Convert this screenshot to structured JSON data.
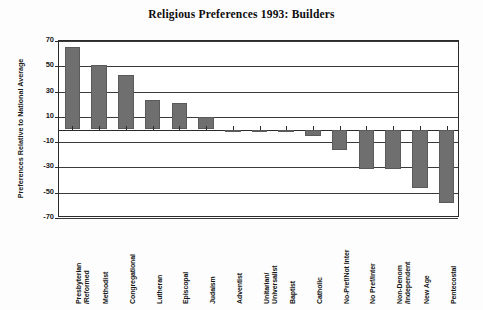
{
  "chart_data": {
    "type": "bar",
    "title": "Religious Preferences 1993: Builders",
    "xlabel": "",
    "ylabel": "Preferences Relative to National Average",
    "ylim": [
      -70,
      70
    ],
    "yticks": [
      70,
      50,
      30,
      10,
      -10,
      -30,
      -50,
      -70
    ],
    "grid": true,
    "legend": "none",
    "orientation": "vertical",
    "bar_color": "#6f6f6f",
    "categories": [
      "Presbyterian\n/Reformed",
      "Methodist",
      "Congregational",
      "Lutheran",
      "Episcopal",
      "Judaism",
      "Adventist",
      "Unitarian/\nUniversalist",
      "Baptist",
      "Catholic",
      "No-Pref/Not Inter",
      "No Pref/Inter",
      "Non-Denom\n/Independent",
      "New Age",
      "Pentecostal"
    ],
    "category_lines": [
      [
        "Presbyterian",
        "/Reformed"
      ],
      [
        "Methodist"
      ],
      [
        "Congregational"
      ],
      [
        "Lutheran"
      ],
      [
        "Episcopal"
      ],
      [
        "Judaism"
      ],
      [
        "Adventist"
      ],
      [
        "Unitarian/",
        "Universalist"
      ],
      [
        "Baptist"
      ],
      [
        "Catholic"
      ],
      [
        "No-Pref/Not Inter"
      ],
      [
        "No Pref/Inter"
      ],
      [
        "Non-Denom",
        "/Independent"
      ],
      [
        "New Age"
      ],
      [
        "Pentecostal"
      ]
    ],
    "values": [
      65,
      51,
      43,
      23,
      21,
      10,
      0,
      0,
      -2,
      -5,
      -16,
      -31,
      -31,
      -46,
      -58
    ]
  }
}
